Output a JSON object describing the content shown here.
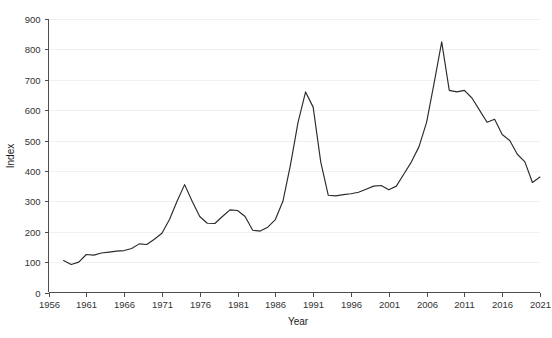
{
  "chart_data": {
    "type": "line",
    "title": "",
    "xlabel": "Year",
    "ylabel": "Index",
    "xlim": [
      1956,
      2021
    ],
    "ylim": [
      0,
      900
    ],
    "grid": true,
    "legend": null,
    "x_ticks": [
      1956,
      1961,
      1966,
      1971,
      1976,
      1981,
      1986,
      1991,
      1996,
      2001,
      2006,
      2011,
      2016,
      2021
    ],
    "y_ticks": [
      0,
      100,
      200,
      300,
      400,
      500,
      600,
      700,
      800,
      900
    ],
    "series": [
      {
        "name": "Index",
        "color": "#2b2b2b",
        "x": [
          1958,
          1959,
          1960,
          1961,
          1962,
          1963,
          1964,
          1965,
          1966,
          1967,
          1968,
          1969,
          1970,
          1971,
          1972,
          1973,
          1974,
          1975,
          1976,
          1977,
          1978,
          1979,
          1980,
          1981,
          1982,
          1983,
          1984,
          1985,
          1986,
          1987,
          1988,
          1989,
          1990,
          1991,
          1992,
          1993,
          1994,
          1995,
          1996,
          1997,
          1998,
          1999,
          2000,
          2001,
          2002,
          2003,
          2004,
          2005,
          2006,
          2007,
          2008,
          2009,
          2010,
          2011,
          2012,
          2013,
          2014,
          2015,
          2016,
          2017,
          2018,
          2019,
          2020,
          2021
        ],
        "values": [
          105,
          92,
          100,
          125,
          123,
          130,
          133,
          136,
          138,
          145,
          160,
          158,
          175,
          195,
          240,
          300,
          355,
          300,
          250,
          228,
          227,
          250,
          272,
          270,
          250,
          205,
          202,
          215,
          240,
          300,
          420,
          560,
          660,
          610,
          430,
          320,
          318,
          322,
          325,
          330,
          340,
          350,
          352,
          338,
          350,
          390,
          430,
          480,
          560,
          690,
          825,
          665,
          660,
          665,
          640,
          600,
          560,
          570,
          520,
          500,
          455,
          430,
          362,
          380
        ]
      }
    ]
  },
  "axes": {
    "x_axis_label": "Year",
    "y_axis_label": "Index"
  }
}
